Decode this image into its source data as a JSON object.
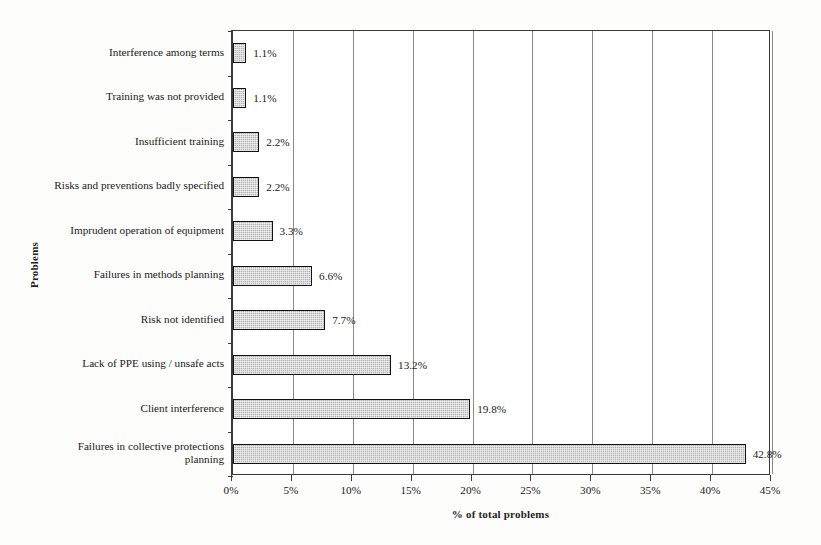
{
  "chart_data": {
    "type": "bar",
    "orientation": "horizontal",
    "title": "",
    "xlabel": "% of total problems",
    "ylabel": "Problems",
    "xlim": [
      0,
      45
    ],
    "xticks": [
      "0%",
      "5%",
      "10%",
      "15%",
      "20%",
      "25%",
      "30%",
      "35%",
      "40%",
      "45%"
    ],
    "xtick_values": [
      0,
      5,
      10,
      15,
      20,
      25,
      30,
      35,
      40,
      45
    ],
    "grid": "vertical",
    "legend": "none",
    "categories": [
      "Interference among terms",
      "Training was not provided",
      "Insufficient training",
      "Risks and preventions badly specified",
      "Imprudent operation of equipment",
      "Failures in methods planning",
      "Risk not identified",
      "Lack of PPE using / unsafe acts",
      "Client interference",
      "Failures in collective protections\nplanning"
    ],
    "values": [
      1.1,
      1.1,
      2.2,
      2.2,
      3.3,
      6.6,
      7.7,
      13.2,
      19.8,
      42.8
    ],
    "value_labels": [
      "1.1%",
      "1.1%",
      "2.2%",
      "2.2%",
      "3.3%",
      "6.6%",
      "7.7%",
      "13.2%",
      "19.8%",
      "42.8%"
    ],
    "bar_fill_color": "#b4b4b4",
    "bar_border_color": "#111111",
    "gridline_color": "#8a8a8a",
    "axis_color": "#3a3a3a",
    "background_color": "#ffffff"
  }
}
